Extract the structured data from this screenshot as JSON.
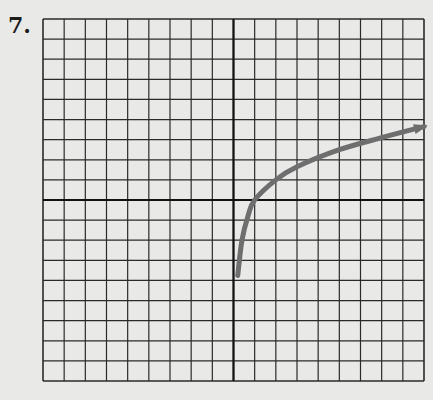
{
  "problem": {
    "number_label": "7."
  },
  "chart_data": {
    "type": "line",
    "title": "",
    "xlabel": "",
    "ylabel": "",
    "grid": true,
    "grid_columns": 18,
    "grid_rows": 18,
    "xlim": [
      -9,
      9
    ],
    "ylim": [
      -9,
      9
    ],
    "axes_through_origin": true,
    "series": [
      {
        "name": "curve",
        "color": "#6e6e6e",
        "arrow_end": true,
        "x": [
          0.2,
          0.4,
          0.7,
          1,
          2,
          3,
          5,
          7,
          9
        ],
        "y": [
          -3.75,
          -2,
          -0.75,
          0,
          1,
          1.65,
          2.5,
          3.1,
          3.65
        ]
      }
    ]
  },
  "colors": {
    "background": "#e9e9e7",
    "grid": "#2a2a2a",
    "curve": "#6e6e6e"
  }
}
